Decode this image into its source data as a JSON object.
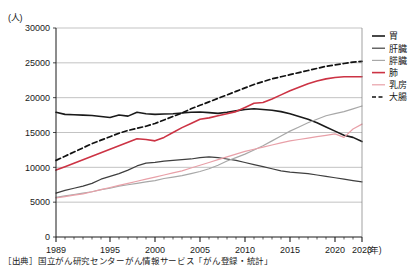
{
  "chart_data": {
    "type": "line",
    "title": "",
    "unit_label": "(人)",
    "xlabel": "(年)",
    "ylabel": "",
    "ylim": [
      0,
      30000
    ],
    "ytick_values": [
      0,
      5000,
      10000,
      15000,
      20000,
      25000,
      30000
    ],
    "ytick_labels": [
      "0",
      "5000",
      "10000",
      "15000",
      "20000",
      "25000",
      "30000"
    ],
    "xlim": [
      1989,
      2023
    ],
    "xtick_major": [
      1989,
      1995,
      2000,
      2005,
      2010,
      2015,
      2020,
      2023
    ],
    "xtick_major_labels": [
      "1989",
      "1995",
      "2000",
      "2005",
      "2010",
      "2015",
      "2020",
      "2023"
    ],
    "grid": "horizontal",
    "legend_position": "right",
    "x": [
      1989,
      1990,
      1991,
      1992,
      1993,
      1994,
      1995,
      1996,
      1997,
      1998,
      1999,
      2000,
      2001,
      2002,
      2003,
      2004,
      2005,
      2006,
      2007,
      2008,
      2009,
      2010,
      2011,
      2012,
      2013,
      2014,
      2015,
      2016,
      2017,
      2018,
      2019,
      2020,
      2021,
      2022,
      2023
    ],
    "series": [
      {
        "name": "胃",
        "color": "#1a1a1a",
        "style": "solid",
        "width": 1.6,
        "values": [
          17900,
          17600,
          17550,
          17500,
          17450,
          17300,
          17150,
          17500,
          17350,
          17900,
          17700,
          17600,
          17650,
          17700,
          17800,
          17900,
          17950,
          17850,
          17750,
          17900,
          18100,
          18300,
          18400,
          18300,
          18200,
          18000,
          17700,
          17300,
          16900,
          16400,
          15800,
          15200,
          14600,
          14300,
          13700
        ]
      },
      {
        "name": "肝臓",
        "color": "#3f3f3f",
        "style": "solid",
        "width": 1.2,
        "values": [
          6300,
          6700,
          7000,
          7300,
          7700,
          8300,
          8700,
          9100,
          9600,
          10200,
          10600,
          10700,
          10900,
          11000,
          11100,
          11200,
          11400,
          11500,
          11400,
          11200,
          11000,
          10700,
          10400,
          10100,
          9800,
          9500,
          9300,
          9200,
          9100,
          8900,
          8700,
          8500,
          8300,
          8100,
          7900
        ]
      },
      {
        "name": "膵臓",
        "color": "#a8a8a8",
        "style": "solid",
        "width": 1.2,
        "values": [
          5700,
          5900,
          6100,
          6300,
          6500,
          6800,
          7000,
          7300,
          7500,
          7700,
          7900,
          8100,
          8400,
          8600,
          8800,
          9100,
          9400,
          9800,
          10300,
          10900,
          11400,
          11900,
          12500,
          13100,
          13800,
          14500,
          15200,
          15800,
          16400,
          16900,
          17400,
          17700,
          18000,
          18400,
          18800
        ]
      },
      {
        "name": "肺",
        "color": "#cc3344",
        "style": "solid",
        "width": 1.6,
        "values": [
          9600,
          10100,
          10600,
          11100,
          11600,
          12100,
          12600,
          13100,
          13600,
          14100,
          14000,
          13800,
          14300,
          15000,
          15700,
          16300,
          16900,
          17100,
          17400,
          17700,
          18000,
          18600,
          19200,
          19300,
          19800,
          20400,
          21000,
          21500,
          22000,
          22400,
          22700,
          22900,
          23000,
          23000,
          23000
        ]
      },
      {
        "name": "乳房",
        "color": "#e8a0a8",
        "style": "solid",
        "width": 1.2,
        "values": [
          5600,
          5800,
          6000,
          6200,
          6500,
          6800,
          7100,
          7400,
          7700,
          8000,
          8300,
          8600,
          8900,
          9200,
          9500,
          9900,
          10300,
          10700,
          11100,
          11500,
          11900,
          12300,
          12600,
          12900,
          13200,
          13500,
          13800,
          14000,
          14200,
          14400,
          14600,
          14800,
          14300,
          15500,
          16200
        ]
      },
      {
        "name": "大腸",
        "color": "#111111",
        "style": "dashed",
        "width": 1.7,
        "values": [
          11000,
          11600,
          12200,
          12800,
          13400,
          13900,
          14400,
          14900,
          15300,
          15600,
          15900,
          16300,
          16800,
          17300,
          17800,
          18400,
          18900,
          19400,
          19900,
          20400,
          20900,
          21400,
          21900,
          22300,
          22700,
          23000,
          23300,
          23600,
          23900,
          24200,
          24500,
          24700,
          24900,
          25100,
          25200
        ]
      }
    ]
  },
  "legend": {
    "items": [
      {
        "label": "胃"
      },
      {
        "label": "肝臓"
      },
      {
        "label": "膵臓"
      },
      {
        "label": "肺"
      },
      {
        "label": "乳房"
      },
      {
        "label": "大腸"
      }
    ]
  },
  "source": {
    "text": "［出典］国立がん研究センターがん情報サービス「がん登録・統計」"
  }
}
